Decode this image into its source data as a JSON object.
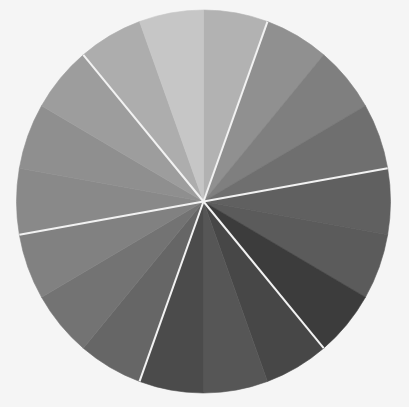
{
  "chart_data": {
    "type": "pie",
    "title": "",
    "start_angle_deg": 0,
    "direction": "clockwise",
    "center": [
      203.5,
      201.5
    ],
    "radius": [
      187,
      191.5
    ],
    "background": "#f5f5f5",
    "separator_color": "#f2f2f2",
    "separator_every_n_slices": 3,
    "separator_angles_deg": [
      20,
      80,
      140,
      200,
      260,
      320
    ],
    "categories": [
      "S1",
      "S2",
      "S3",
      "S4",
      "S5",
      "S6",
      "S7",
      "S8",
      "S9",
      "S10",
      "S11",
      "S12",
      "S13",
      "S14",
      "S15",
      "S16",
      "S17",
      "S18"
    ],
    "values": [
      20,
      20,
      20,
      20,
      20,
      20,
      20,
      20,
      20,
      20,
      20,
      20,
      20,
      20,
      20,
      20,
      20,
      20
    ],
    "colors": [
      "#b2b2b2",
      "#909090",
      "#7f7f7f",
      "#6f6f6f",
      "#606060",
      "#5b5b5b",
      "#3c3c3c",
      "#474747",
      "#565656",
      "#4b4b4b",
      "#666666",
      "#737373",
      "#818181",
      "#898989",
      "#8f8f8f",
      "#9d9d9d",
      "#adadad",
      "#c6c6c6"
    ],
    "legend": null,
    "labels_shown": false
  }
}
